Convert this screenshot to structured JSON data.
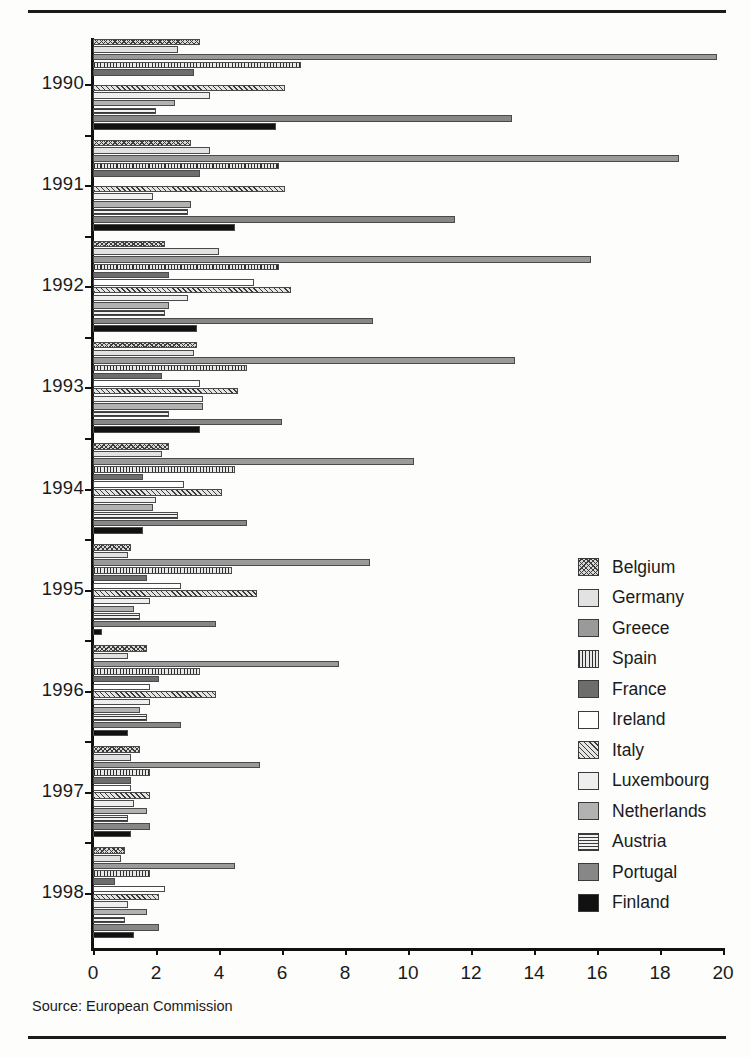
{
  "source_note": "Source: European Commission",
  "chart_data": {
    "type": "bar",
    "orientation": "horizontal",
    "title": "",
    "subtitle": "",
    "xlabel": "",
    "ylabel": "",
    "xlim": [
      0,
      20
    ],
    "xticks": [
      0,
      2,
      4,
      6,
      8,
      10,
      12,
      14,
      16,
      18,
      20
    ],
    "xtick_labels": [
      "0",
      "2",
      "4",
      "6",
      "8",
      "10",
      "12",
      "14",
      "16",
      "18",
      "20"
    ],
    "grid": false,
    "legend_position": "right",
    "categories": [
      "1990",
      "1991",
      "1992",
      "1993",
      "1994",
      "1995",
      "1996",
      "1997",
      "1998"
    ],
    "series": [
      {
        "name": "Belgium",
        "pattern": "cross-hatch",
        "color": "#d8d8d8",
        "values": [
          3.4,
          3.1,
          2.3,
          3.3,
          2.4,
          1.2,
          1.7,
          1.5,
          1.0
        ]
      },
      {
        "name": "Germany",
        "pattern": "solid-light-gray",
        "color": "#e2e2e2",
        "values": [
          2.7,
          3.7,
          4.0,
          3.2,
          2.2,
          1.1,
          1.1,
          1.2,
          0.9
        ]
      },
      {
        "name": "Greece",
        "pattern": "solid-mid-gray",
        "color": "#9a9a9a",
        "values": [
          19.8,
          18.6,
          15.8,
          13.4,
          10.2,
          8.8,
          7.8,
          5.3,
          4.5
        ]
      },
      {
        "name": "Spain",
        "pattern": "vertical-lines",
        "color": "#e8e8e8",
        "values": [
          6.6,
          5.9,
          5.9,
          4.9,
          4.5,
          4.4,
          3.4,
          1.8,
          1.8
        ]
      },
      {
        "name": "France",
        "pattern": "solid-dark-gray",
        "color": "#6d6d6d",
        "values": [
          3.2,
          3.4,
          2.4,
          2.2,
          1.6,
          1.7,
          2.1,
          1.2,
          0.7
        ]
      },
      {
        "name": "Ireland",
        "pattern": "white",
        "color": "#ffffff",
        "values": [
          0.0,
          0.0,
          5.1,
          3.4,
          2.9,
          2.8,
          1.8,
          1.2,
          2.3
        ]
      },
      {
        "name": "Italy",
        "pattern": "diagonal-hatch",
        "color": "#e4e4e4",
        "values": [
          6.1,
          6.1,
          6.3,
          4.6,
          4.1,
          5.2,
          3.9,
          1.8,
          2.1
        ]
      },
      {
        "name": "Luxembourg",
        "pattern": "solid-very-light",
        "color": "#efefef",
        "values": [
          3.7,
          1.9,
          3.0,
          3.5,
          2.0,
          1.8,
          1.8,
          1.3,
          1.1
        ]
      },
      {
        "name": "Netherlands",
        "pattern": "solid-gray",
        "color": "#b2b2b2",
        "values": [
          2.6,
          3.1,
          2.4,
          3.5,
          1.9,
          1.3,
          1.5,
          1.7,
          1.7
        ]
      },
      {
        "name": "Austria",
        "pattern": "horizontal-lines",
        "color": "#f2f2f2",
        "values": [
          2.0,
          3.0,
          2.3,
          2.4,
          2.7,
          1.5,
          1.7,
          1.1,
          1.0
        ]
      },
      {
        "name": "Portugal",
        "pattern": "solid-dark",
        "color": "#878787",
        "values": [
          13.3,
          11.5,
          8.9,
          6.0,
          4.9,
          3.9,
          2.8,
          1.8,
          2.1
        ]
      },
      {
        "name": "Finland",
        "pattern": "black",
        "color": "#111111",
        "values": [
          5.8,
          4.5,
          3.3,
          3.4,
          1.6,
          0.3,
          1.1,
          1.2,
          1.3
        ]
      }
    ]
  },
  "legend": {
    "items": [
      {
        "label": "Belgium"
      },
      {
        "label": "Germany"
      },
      {
        "label": "Greece"
      },
      {
        "label": "Spain"
      },
      {
        "label": "France"
      },
      {
        "label": "Ireland"
      },
      {
        "label": "Italy"
      },
      {
        "label": "Luxembourg"
      },
      {
        "label": "Netherlands"
      },
      {
        "label": "Austria"
      },
      {
        "label": "Portugal"
      },
      {
        "label": "Finland"
      }
    ]
  }
}
